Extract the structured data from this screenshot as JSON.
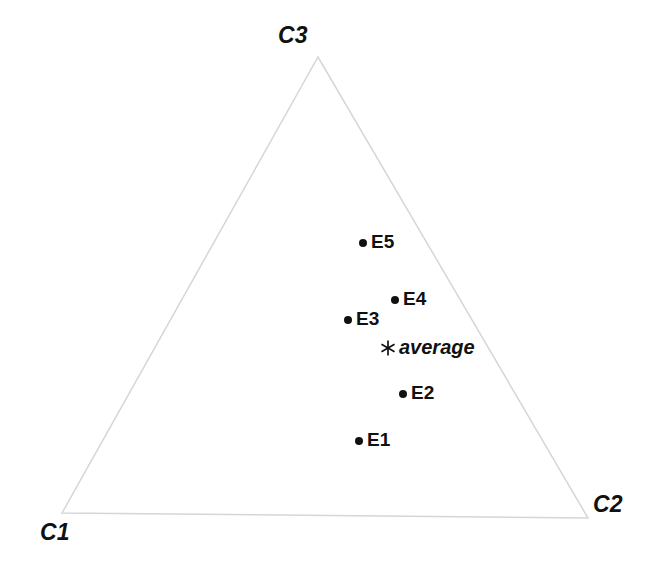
{
  "chart_data": {
    "type": "scatter",
    "plot_kind": "ternary-diagram",
    "title": "",
    "xlabel": "",
    "ylabel": "",
    "grid": false,
    "legend": "none",
    "background_color": "#ffffff",
    "triangle": {
      "stroke_color": "#d6d6d6",
      "stroke_width": 1.5,
      "fill": "none",
      "vertices": [
        {
          "name": "C3",
          "x": 318,
          "y": 57
        },
        {
          "name": "C2",
          "x": 588,
          "y": 518
        },
        {
          "name": "C1",
          "x": 62,
          "y": 513
        }
      ]
    },
    "axis_labels": [
      {
        "id": "c3",
        "text": "C3",
        "x": 278,
        "y": 24
      },
      {
        "id": "c1",
        "text": "C1",
        "x": 40,
        "y": 521
      },
      {
        "id": "c2",
        "text": "C2",
        "x": 593,
        "y": 493
      }
    ],
    "points": [
      {
        "label": "E5",
        "x": 363,
        "y": 243,
        "marker": "dot",
        "color": "#111111"
      },
      {
        "label": "E4",
        "x": 395,
        "y": 300,
        "marker": "dot",
        "color": "#111111"
      },
      {
        "label": "E3",
        "x": 348,
        "y": 320,
        "marker": "dot",
        "color": "#111111"
      },
      {
        "label": "E2",
        "x": 403,
        "y": 394,
        "marker": "dot",
        "color": "#111111"
      },
      {
        "label": "E1",
        "x": 359,
        "y": 441,
        "marker": "dot",
        "color": "#111111"
      }
    ],
    "average_point": {
      "label": "average",
      "x": 388,
      "y": 348,
      "marker": "asterisk",
      "color": "#111111"
    }
  }
}
